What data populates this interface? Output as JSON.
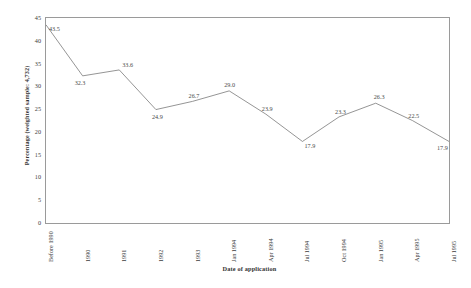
{
  "chart_data": {
    "type": "line",
    "title": "",
    "xlabel": "Date of application",
    "ylabel": "Percentage (weighted sample: 4,732)",
    "categories": [
      "Before 1990",
      "1990",
      "1991",
      "1992",
      "1993",
      "Jan 1994",
      "Apr 1994",
      "Jul 1994",
      "Oct 1994",
      "Jan 1995",
      "Apr 1995",
      "Jul 1995"
    ],
    "values": [
      43.5,
      32.3,
      33.6,
      24.9,
      26.7,
      29.0,
      23.9,
      17.9,
      23.3,
      26.3,
      22.5,
      17.9
    ],
    "point_labels": [
      "43.5",
      "32.3",
      "33.6",
      "24.9",
      "26.7",
      "29.0",
      "23.9",
      "17.9",
      "23.3",
      "26.3",
      "22.5",
      "17.9"
    ],
    "ylim": [
      0,
      45
    ],
    "yticks": [
      0,
      5,
      10,
      15,
      20,
      25,
      30,
      35,
      40,
      45
    ],
    "ytick_labels": [
      "0",
      "5",
      "10",
      "15",
      "20",
      "25",
      "30",
      "35",
      "40",
      "45"
    ],
    "grid": false,
    "legend": null,
    "line_color": "#7a7a7a",
    "frame_color": "#9a9a9a",
    "text_color": "#3d3d3d",
    "background": "#ffffff"
  }
}
